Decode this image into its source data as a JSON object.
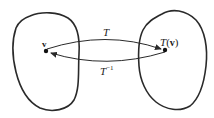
{
  "diagram": {
    "type": "mapping",
    "domain_set": {
      "point_label": "v",
      "point": [
        46,
        51
      ]
    },
    "codomain_set": {
      "point_label_fn": "T",
      "point_label_arg": "v",
      "point_label_open": "(",
      "point_label_close": ")",
      "point": [
        165,
        50
      ]
    },
    "forward_map": {
      "label": "T",
      "direction": "domain-to-codomain"
    },
    "inverse_map": {
      "label": "T",
      "superscript": "−1",
      "direction": "codomain-to-domain"
    },
    "colors": {
      "stroke": "#2a2a2a",
      "background": "#ffffff"
    }
  }
}
